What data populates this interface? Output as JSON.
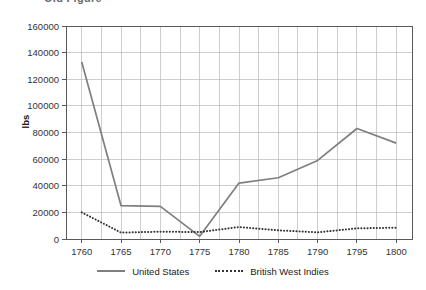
{
  "figure": {
    "title_partial": "Old Figure",
    "title_cut_off": true
  },
  "axes": {
    "ylabel": "lbs",
    "xlabel": "",
    "yticks": [
      "0",
      "20000",
      "40000",
      "60000",
      "80000",
      "100000",
      "120000",
      "140000",
      "160000"
    ],
    "xticks": [
      "1760",
      "1765",
      "1770",
      "1775",
      "1780",
      "1785",
      "1790",
      "1795",
      "1800"
    ]
  },
  "legend": {
    "position": "bottom-center",
    "entries": [
      {
        "label": "United States",
        "style": "solid",
        "color": "#7f7f7f",
        "icon": "solid-line-swatch"
      },
      {
        "label": "British West Indies",
        "style": "dotted",
        "color": "#333333",
        "icon": "dotted-line-swatch"
      }
    ]
  },
  "colors": {
    "united_states": "#7f7f7f",
    "british_west_indies": "#333333",
    "grid": "#b9b9b9",
    "axis": "#595959",
    "text": "#1a1a1a",
    "background": "#ffffff"
  },
  "chart_data": {
    "type": "line",
    "title": "Old Figure",
    "xlabel": "",
    "ylabel": "lbs",
    "x": [
      1760,
      1765,
      1770,
      1775,
      1780,
      1785,
      1790,
      1795,
      1800
    ],
    "xlim": [
      1758,
      1802
    ],
    "ylim": [
      0,
      160000
    ],
    "ytick_step": 20000,
    "xtick_step": 5,
    "grid": true,
    "legend_position": "bottom-center",
    "series": [
      {
        "name": "United States",
        "style": "solid",
        "color": "#7f7f7f",
        "values": [
          133000,
          25000,
          24500,
          2000,
          42000,
          46000,
          59000,
          83000,
          72000
        ]
      },
      {
        "name": "British West Indies",
        "style": "dotted",
        "color": "#333333",
        "values": [
          20000,
          4800,
          5500,
          5200,
          9000,
          6500,
          5000,
          8000,
          8500
        ]
      }
    ]
  }
}
